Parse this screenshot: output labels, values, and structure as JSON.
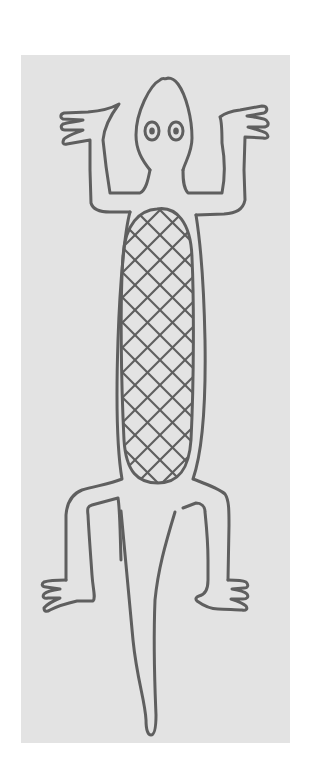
{
  "image": {
    "description": "Line drawing of a lizard seen from above, with a cross-hatched belly, on a light gray panel",
    "subject": "lizard",
    "style": "hand-drawn outline, cross-hatched body",
    "colors": {
      "page_background": "#ffffff",
      "panel_background": "#e3e3e3",
      "ink": "#5f5f5f"
    },
    "parts": [
      "head",
      "eyes",
      "front-left-leg",
      "front-right-leg",
      "body",
      "belly-crosshatch",
      "hind-left-leg",
      "hind-right-leg",
      "tail"
    ]
  }
}
